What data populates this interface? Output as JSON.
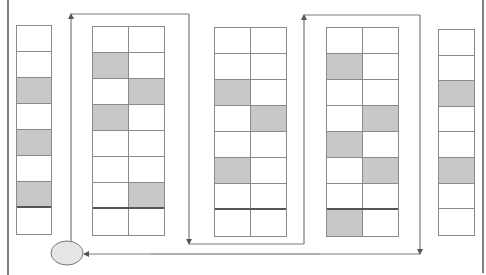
{
  "diagram": {
    "type": "warehouse picking route",
    "colors": {
      "line": "#8a8a8a",
      "shaded_cell": "#c8c8c8",
      "path": "#7a7a7a",
      "depot_fill": "#e6e6e6"
    },
    "shelves": [
      {
        "id": "shelf-1",
        "columns": 1,
        "x": 16,
        "y": 25,
        "width": 36,
        "row_height": 26,
        "thick_before_last": true,
        "rows": [
          [
            false
          ],
          [
            false
          ],
          [
            true
          ],
          [
            false
          ],
          [
            true
          ],
          [
            false
          ],
          [
            true
          ],
          [
            false
          ]
        ]
      },
      {
        "id": "shelf-2",
        "columns": 2,
        "x": 92,
        "y": 26,
        "width": 73,
        "row_height": 26,
        "thick_before_last": true,
        "rows": [
          [
            false,
            false
          ],
          [
            true,
            false
          ],
          [
            false,
            true
          ],
          [
            true,
            false
          ],
          [
            false,
            false
          ],
          [
            false,
            false
          ],
          [
            false,
            true
          ],
          [
            false,
            false
          ]
        ]
      },
      {
        "id": "shelf-3",
        "columns": 2,
        "x": 214,
        "y": 27,
        "width": 73,
        "row_height": 26,
        "thick_before_last": true,
        "rows": [
          [
            false,
            false
          ],
          [
            false,
            false
          ],
          [
            true,
            false
          ],
          [
            false,
            true
          ],
          [
            false,
            false
          ],
          [
            true,
            false
          ],
          [
            false,
            false
          ],
          [
            false,
            false
          ]
        ]
      },
      {
        "id": "shelf-4",
        "columns": 2,
        "x": 326,
        "y": 27,
        "width": 73,
        "row_height": 26,
        "thick_before_last": true,
        "rows": [
          [
            false,
            false
          ],
          [
            true,
            false
          ],
          [
            false,
            false
          ],
          [
            false,
            true
          ],
          [
            true,
            false
          ],
          [
            false,
            true
          ],
          [
            false,
            false
          ],
          [
            true,
            false
          ]
        ]
      },
      {
        "id": "shelf-5",
        "columns": 1,
        "x": 438,
        "y": 29,
        "width": 37,
        "row_height": 25.6,
        "thick_before_last": false,
        "rows": [
          [
            false
          ],
          [
            false
          ],
          [
            true
          ],
          [
            false
          ],
          [
            false
          ],
          [
            true
          ],
          [
            false
          ],
          [
            false
          ]
        ]
      }
    ],
    "depot": {
      "label": "depot",
      "cx": 67,
      "cy": 253,
      "rx": 16,
      "ry": 12
    },
    "route_points": [
      [
        71,
        241
      ],
      [
        71,
        14
      ],
      [
        189,
        14
      ],
      [
        189,
        244
      ],
      [
        304,
        244
      ],
      [
        304,
        15
      ],
      [
        420,
        15
      ],
      [
        420,
        254
      ],
      [
        84,
        254
      ]
    ],
    "border_lines": [
      {
        "x1": 8,
        "y1": 0,
        "x2": 8,
        "y2": 275
      },
      {
        "x1": 483,
        "y1": 0,
        "x2": 483,
        "y2": 273
      }
    ]
  }
}
